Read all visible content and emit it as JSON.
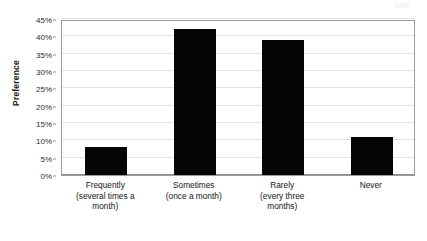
{
  "chart_data": {
    "type": "bar",
    "title": "",
    "subtitle": "",
    "xlabel": "",
    "ylabel": "Preference",
    "categories": [
      "Frequently (several times a month)",
      "Sometimes (once a month)",
      "Rarely (every three months)",
      "Never"
    ],
    "category_lines": [
      [
        "Frequently",
        "(several times a",
        "month)"
      ],
      [
        "Sometimes",
        "(once a month)"
      ],
      [
        "Rarely",
        "(every three",
        "months)"
      ],
      [
        "Never"
      ]
    ],
    "values": [
      8,
      42,
      39,
      11
    ],
    "value_labels": [
      "8%",
      "42%",
      "39%",
      "11%"
    ],
    "ylim": [
      0,
      45
    ],
    "ytick_step": 5,
    "ytick_labels": [
      "0%",
      "5%",
      "10%",
      "15%",
      "20%",
      "25%",
      "30%",
      "35%",
      "40%",
      "45%"
    ],
    "ytick_values": [
      0,
      5,
      10,
      15,
      20,
      25,
      30,
      35,
      40,
      45
    ],
    "grid": true,
    "grid_axis": "y",
    "legend": false,
    "legend_position": "none",
    "bar_color": "#050505",
    "grid_color": "#e2e2e2",
    "axis_color": "#8f8f8f",
    "background_color": "#ffffff",
    "text_color": "#141414"
  }
}
